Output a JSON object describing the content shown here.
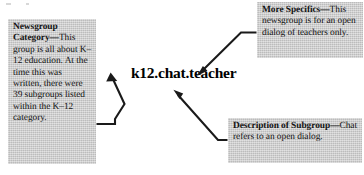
{
  "figure": {
    "newsgroup_name": "k12.chat.teacher",
    "callouts": [
      {
        "id": "newsgroup-category",
        "heading": "Newsgroup Category",
        "dash": "—",
        "body": "This group is all about K–12 education. At the time this was written, there were 39 subgroups listed within the K–12 category."
      },
      {
        "id": "more-specifics",
        "heading": "More Specifics",
        "dash": "—",
        "body": "This newsgroup is for an open dialog of teachers only."
      },
      {
        "id": "description-subgroup",
        "heading": "Description of Subgroup",
        "dash": "—",
        "body": "Chat refers to an open dialog."
      }
    ],
    "connectors": [
      {
        "id": "arrow-category-to-name",
        "from": "newsgroup-category",
        "to": "newsgroup-name",
        "direction": "up"
      },
      {
        "id": "arrow-specifics-to-name",
        "from": "more-specifics",
        "to": "newsgroup-name",
        "direction": "down-left"
      },
      {
        "id": "arrow-description-to-name",
        "from": "description-subgroup",
        "to": "newsgroup-name",
        "direction": "up-left"
      }
    ],
    "colors": {
      "page_background": "#ffffff",
      "callout_background": "#c9c9c9",
      "text": "#121212",
      "arrow": "#1a1a1a"
    }
  }
}
